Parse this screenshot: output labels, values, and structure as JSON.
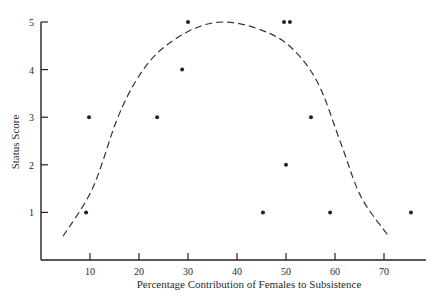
{
  "chart_data": {
    "type": "scatter",
    "title": "",
    "xlabel": "Percentage Contribution of Females to Subsistence",
    "ylabel": "Status Score",
    "xlim": [
      0,
      78
    ],
    "ylim": [
      0,
      5
    ],
    "x_ticks": [
      10,
      20,
      30,
      40,
      50,
      60,
      70
    ],
    "y_ticks": [
      1,
      2,
      3,
      4,
      5
    ],
    "grid": false,
    "legend": null,
    "series": [
      {
        "name": "observations",
        "kind": "points",
        "points": [
          {
            "x": 9.2,
            "y": 1
          },
          {
            "x": 9.8,
            "y": 3
          },
          {
            "x": 23.7,
            "y": 3
          },
          {
            "x": 28.8,
            "y": 4
          },
          {
            "x": 30,
            "y": 5
          },
          {
            "x": 45.3,
            "y": 1
          },
          {
            "x": 49.6,
            "y": 5
          },
          {
            "x": 50.8,
            "y": 5
          },
          {
            "x": 50,
            "y": 2
          },
          {
            "x": 55.1,
            "y": 3
          },
          {
            "x": 59,
            "y": 1
          },
          {
            "x": 75.5,
            "y": 1
          }
        ]
      },
      {
        "name": "fitted-curve",
        "kind": "dashed-line",
        "points": [
          {
            "x": 4.5,
            "y": 0.5
          },
          {
            "x": 10.5,
            "y": 1.5
          },
          {
            "x": 15.5,
            "y": 2.95
          },
          {
            "x": 19.6,
            "y": 3.8
          },
          {
            "x": 24.3,
            "y": 4.4
          },
          {
            "x": 31,
            "y": 4.85
          },
          {
            "x": 37.5,
            "y": 5
          },
          {
            "x": 45,
            "y": 4.83
          },
          {
            "x": 51,
            "y": 4.47
          },
          {
            "x": 56.5,
            "y": 3.72
          },
          {
            "x": 61.2,
            "y": 2.45
          },
          {
            "x": 65.3,
            "y": 1.33
          },
          {
            "x": 70.8,
            "y": 0.52
          }
        ]
      }
    ]
  }
}
